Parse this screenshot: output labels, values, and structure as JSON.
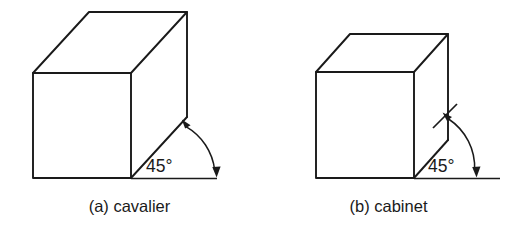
{
  "figure": {
    "background_color": "#ffffff",
    "line_color": "#1a1a1a",
    "panels": [
      {
        "id": "cavalier",
        "caption": "(a) cavalier",
        "angle_label": "45°",
        "angle_degrees": 45,
        "receding_axis_scale": "full depth",
        "shape": "rectangular box",
        "front_face": {
          "x": 33,
          "y": 73,
          "width": 98,
          "height": 105
        },
        "receding_offset": {
          "dx": 56,
          "dy": -61
        },
        "baseline": {
          "x1": 131,
          "x2": 217,
          "y": 178
        },
        "arc_from_vertex": {
          "x": 187,
          "y": 120
        },
        "arc_to_baseline": {
          "x": 217,
          "y": 178
        },
        "angle_text_position": {
          "x": 146,
          "y": 172
        }
      },
      {
        "id": "cabinet",
        "caption": "(b) cabinet",
        "angle_label": "45°",
        "angle_degrees": 45,
        "receding_axis_scale": "half depth",
        "shape": "cube",
        "front_face": {
          "x": 316,
          "y": 72,
          "width": 98,
          "height": 106
        },
        "receding_offset": {
          "dx": 34,
          "dy": -38
        },
        "baseline": {
          "x1": 414,
          "x2": 500,
          "y": 178
        },
        "leader_line": {
          "x1": 433,
          "y1": 128,
          "x2": 457,
          "y2": 104
        },
        "arc_to_baseline": {
          "x": 477,
          "y": 178
        },
        "angle_text_position": {
          "x": 428,
          "y": 172
        }
      }
    ]
  }
}
